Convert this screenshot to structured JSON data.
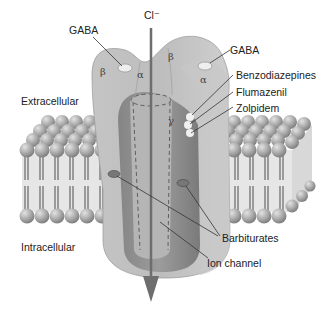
{
  "diagram": {
    "ion": "Cl⁻",
    "regions": {
      "extracellular": "Extracellular",
      "intracellular": "Intracellular"
    },
    "subunits": {
      "beta_left": "β",
      "alpha_left": "α",
      "beta_right": "β",
      "alpha_right": "α",
      "gamma": "γ"
    },
    "labels": {
      "gaba_left": "GABA",
      "gaba_right": "GABA",
      "benzodiazepines": "Benzodiazepines",
      "flumazenil": "Flumazenil",
      "zolpidem": "Zolpidem",
      "barbiturates": "Barbiturates",
      "ion_channel": "Ion channel"
    },
    "colors": {
      "receptor_light": "#bdbdbd",
      "receptor_mid": "#9a9a9a",
      "receptor_dark": "#7a7a7a",
      "lipid_head": "#a8a8a8",
      "arrow": "#6e6e6e"
    }
  }
}
